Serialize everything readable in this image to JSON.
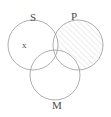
{
  "diagram": {
    "kind": "venn-diagram",
    "title": "",
    "background_color": "#ffffff",
    "stroke_color": "#999999",
    "stroke_width": 0.8,
    "label_color": "#4a4a4a",
    "mark_color": "#555555",
    "hatch": {
      "color": "#cfcfcf",
      "angle_deg": 45,
      "spacing_px": 4,
      "line_width": 0.8,
      "description": "diagonal lines running lower-left to upper-right"
    },
    "circles": [
      {
        "id": "S",
        "label": "S",
        "cx": 33,
        "cy": 45,
        "r": 25,
        "shaded": false
      },
      {
        "id": "P",
        "label": "P",
        "cx": 78,
        "cy": 45,
        "r": 25,
        "shaded": true
      },
      {
        "id": "M",
        "label": "M",
        "cx": 55,
        "cy": 75,
        "r": 25,
        "shaded": false
      }
    ],
    "labels": [
      {
        "id": "label-s",
        "text": "S",
        "for_circle": "S",
        "position": "top"
      },
      {
        "id": "label-p",
        "text": "P",
        "for_circle": "P",
        "position": "top"
      },
      {
        "id": "label-m",
        "text": "M",
        "for_circle": "M",
        "position": "bottom"
      }
    ],
    "marks": [
      {
        "id": "mark-x",
        "text": "x",
        "region": "S-only",
        "meaning": "existential marker"
      }
    ],
    "shaded_regions": [
      {
        "id": "p-exclusive",
        "description": "P circle excluding its overlap with S and with M",
        "fill": "hatch"
      }
    ]
  }
}
